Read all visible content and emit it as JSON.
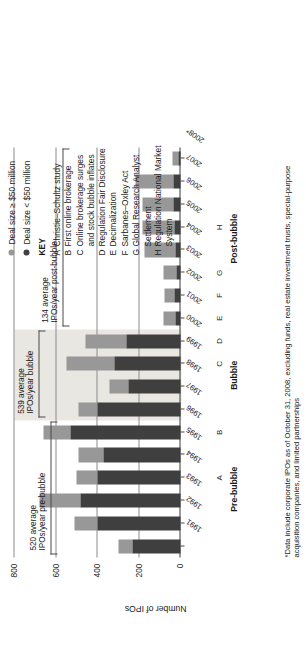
{
  "legend": {
    "items": [
      {
        "label": "Deal size ≥ $50 million",
        "color": "#989898",
        "name": "legend-large-deal"
      },
      {
        "label": "Deal size < $50 million",
        "color": "#3f3f3f",
        "name": "legend-small-deal"
      }
    ]
  },
  "key": {
    "heading": "KEY",
    "items": [
      {
        "letter": "A",
        "text": "Christie–Schultz study",
        "cont": ""
      },
      {
        "letter": "B",
        "text": "First online brokerage",
        "cont": ""
      },
      {
        "letter": "C",
        "text": "Online brokerage surges",
        "cont": "and stock bubble inflates"
      },
      {
        "letter": "D",
        "text": "Regulation Fair Disclosure",
        "cont": ""
      },
      {
        "letter": "E",
        "text": "Decimalization",
        "cont": ""
      },
      {
        "letter": "F",
        "text": "Sarbanes–Oxley Act",
        "cont": ""
      },
      {
        "letter": "G",
        "text": "Global Research Analyst",
        "cont": "Settlement"
      },
      {
        "letter": "H",
        "text": "Regulation National Market System",
        "cont": ""
      }
    ]
  },
  "annotations": [
    {
      "name": "annot-pre-bubble",
      "line1": "520 average",
      "line2": "IPOs/year pre-bubble"
    },
    {
      "name": "annot-bubble",
      "line1": "539 average",
      "line2": "IPOs/year bubble"
    },
    {
      "name": "annot-post-bubble",
      "line1": "134 average",
      "line2": "IPOs/year post-bubble"
    }
  ],
  "periods": [
    {
      "label": "Pre-bubble",
      "from": "1991",
      "to": "1996"
    },
    {
      "label": "Bubble",
      "from": "1997",
      "to": "2000"
    },
    {
      "label": "Post-bubble",
      "from": "2001",
      "to": "2008*"
    }
  ],
  "event_markers": [
    {
      "letter": "A",
      "year": "1994"
    },
    {
      "letter": "B",
      "year": "1996"
    },
    {
      "letter": "C",
      "year": "1999"
    },
    {
      "letter": "D",
      "year": "2000"
    },
    {
      "letter": "E",
      "year": "2001"
    },
    {
      "letter": "F",
      "year": "2002"
    },
    {
      "letter": "G",
      "year": "2003"
    },
    {
      "letter": "H",
      "year": "2005"
    }
  ],
  "footnote": "*Data include corporate IPOs as of October 31, 2008, excluding funds, real estate investment trusts, special-purpose acquisition companies, and limited partnerships",
  "chart_data": {
    "type": "bar",
    "title": "",
    "xlabel": "",
    "ylabel": "Number of IPOs",
    "ylim": [
      0,
      800
    ],
    "yticks": [
      "0",
      "200",
      "400",
      "600",
      "800"
    ],
    "grid": true,
    "stacked": true,
    "legend_position": "top-right",
    "categories": [
      "1991",
      "1992",
      "1993",
      "1994",
      "1995",
      "1996",
      "1997",
      "1998",
      "1999",
      "2000",
      "2001",
      "2002",
      "2003",
      "2004",
      "2005",
      "2006",
      "2007",
      "2008*"
    ],
    "series": [
      {
        "name": "Deal size < $50 million",
        "color": "#3f3f3f",
        "values": [
          230,
          400,
          480,
          400,
          370,
          530,
          400,
          250,
          320,
          260,
          25,
          30,
          20,
          25,
          30,
          35,
          35,
          12
        ]
      },
      {
        "name": "Deal size ≥ $50 million",
        "color": "#989898",
        "values": [
          70,
          110,
          200,
          100,
          120,
          130,
          90,
          90,
          230,
          200,
          55,
          45,
          60,
          150,
          155,
          150,
          180,
          25
        ]
      }
    ],
    "totals": [
      300,
      510,
      680,
      500,
      490,
      660,
      490,
      340,
      550,
      460,
      80,
      75,
      80,
      175,
      185,
      185,
      215,
      37
    ]
  }
}
